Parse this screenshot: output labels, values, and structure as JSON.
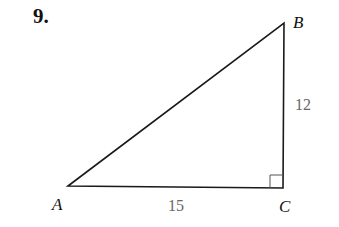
{
  "problem": {
    "number": "9."
  },
  "triangle": {
    "vertices": {
      "A": {
        "label": "A"
      },
      "B": {
        "label": "B"
      },
      "C": {
        "label": "C"
      }
    },
    "sides": {
      "AC": {
        "label": "15"
      },
      "BC": {
        "label": "12"
      }
    },
    "right_angle_at": "C"
  }
}
